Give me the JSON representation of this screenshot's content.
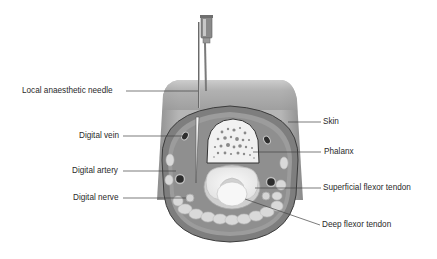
{
  "figure": {
    "labels_left": [
      {
        "id": "needle",
        "text": "Local anaesthetic needle"
      },
      {
        "id": "vein",
        "text": "Digital vein"
      },
      {
        "id": "artery",
        "text": "Digital artery"
      },
      {
        "id": "nerve",
        "text": "Digital nerve"
      }
    ],
    "labels_right": [
      {
        "id": "skin",
        "text": "Skin"
      },
      {
        "id": "phalanx",
        "text": "Phalanx"
      },
      {
        "id": "superficial",
        "text": "Superficial flexor tendon"
      },
      {
        "id": "deep",
        "text": "Deep flexor tendon"
      }
    ]
  },
  "colors": {
    "background": "#ffffff",
    "finger_outer": "#a9a9a9",
    "finger_shading": "#8c8c8c",
    "skin_ring": "#7c7c7c",
    "subcutaneous": "#9a9a9a",
    "fat_lobules": "#d8d8d8",
    "bone": "#f1f1f1",
    "tendon": "#f4f4f4",
    "leader_line": "#444444",
    "label_text": "#2a2a2a"
  }
}
